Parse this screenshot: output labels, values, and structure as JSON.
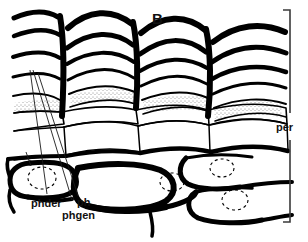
{
  "figure": {
    "panel_label": "B",
    "background_color": "#ffffff",
    "ink_color": "#000000"
  },
  "annotations": {
    "right_bracket_label": "per",
    "bottom_labels": [
      {
        "id": "phder",
        "text": "phder"
      },
      {
        "id": "ph",
        "text": "ph"
      },
      {
        "id": "phgen",
        "text": "phgen"
      }
    ]
  },
  "structure": {
    "column_count": 4,
    "phellem_rows": 5,
    "stipple_band_label": "suberized-stippled-band",
    "nuclei_count": 4
  }
}
